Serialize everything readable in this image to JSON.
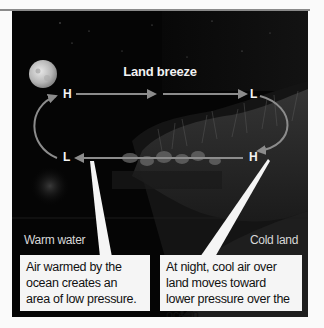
{
  "diagram": {
    "title": "Land breeze",
    "pressure_labels": {
      "top_left": "H",
      "top_right": "L",
      "bottom_left": "L",
      "bottom_right": "H"
    },
    "regions": {
      "left": "Warm water",
      "right": "Cold land"
    },
    "callouts": [
      {
        "text": "Air warmed by the ocean creates an area of low pressure."
      },
      {
        "text": "At night, cool air over land moves toward lower pressure over the ocean."
      }
    ],
    "colors": {
      "background": "#050505",
      "arrow": "#8c8c8c",
      "callout_bg": "#f5f5f5",
      "text": "#f4f4f4"
    }
  }
}
